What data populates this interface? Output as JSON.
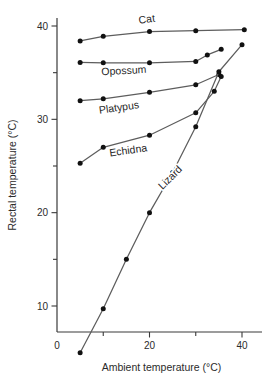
{
  "chart_data": {
    "type": "line",
    "title": "",
    "subtitle": "",
    "xlabel": "Ambient temperature (°C)",
    "ylabel": "Rectal temperature (°C)",
    "xlim": [
      0,
      43
    ],
    "ylim": [
      3,
      41.5
    ],
    "x_ticks_major": [
      0,
      20,
      40
    ],
    "x_ticks_minor": [
      10,
      30
    ],
    "x_tick_labels": [
      "0",
      "20",
      "40"
    ],
    "y_ticks_major": [
      10,
      20,
      30,
      40
    ],
    "y_ticks_minor": [
      15,
      25,
      35
    ],
    "y_tick_labels": [
      "10",
      "20",
      "30",
      "40"
    ],
    "grid": false,
    "legend": "inline-labels",
    "legend_position": "on-curve",
    "marker": "filled-circle",
    "line_color": "#5d5d5d",
    "marker_color": "#111111",
    "axis_color": "#3a3a3a",
    "series": [
      {
        "name": "Cat",
        "label": "Cat",
        "label_x": 19.5,
        "label_y": 40.35,
        "label_rotation": -7,
        "x": [
          5,
          10,
          20,
          30,
          40.5
        ],
        "values": [
          38.4,
          38.9,
          39.4,
          39.5,
          39.6
        ]
      },
      {
        "name": "Opossum",
        "label": "Opossum",
        "label_x": 14.5,
        "label_y": 34.85,
        "label_rotation": -3,
        "x": [
          5,
          10,
          20,
          30,
          32.5,
          35.5
        ],
        "values": [
          36.1,
          36.05,
          36.05,
          36.2,
          36.9,
          37.5
        ]
      },
      {
        "name": "Platypus",
        "label": "Platypus",
        "label_x": 13.5,
        "label_y": 30.9,
        "label_rotation": -8,
        "x": [
          5,
          10,
          20,
          30,
          35
        ],
        "values": [
          32.0,
          32.2,
          32.9,
          33.7,
          34.8
        ]
      },
      {
        "name": "Echidna",
        "label": "Echidna",
        "label_x": 15.5,
        "label_y": 26.3,
        "label_rotation": -8,
        "x": [
          5,
          10,
          20,
          30,
          34,
          35.5
        ],
        "values": [
          25.3,
          27.0,
          28.3,
          30.7,
          33.0,
          34.6
        ]
      },
      {
        "name": "Lizard",
        "label": "Lizard",
        "label_x": 25.0,
        "label_y": 23.5,
        "label_rotation": -45,
        "x": [
          5,
          10,
          15,
          20,
          25,
          30,
          35,
          40
        ],
        "values": [
          5.0,
          9.7,
          15.0,
          20.0,
          24.3,
          29.2,
          35.1,
          38.0
        ]
      }
    ]
  }
}
